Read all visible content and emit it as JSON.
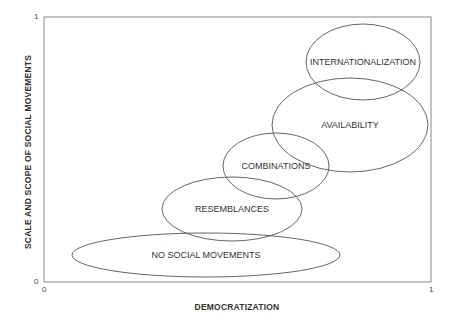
{
  "diagram": {
    "y_axis": {
      "label": "SCALE AND SCOPE OF SOCIAL MOVEMENTS",
      "min_tick": "0",
      "max_tick": "1"
    },
    "x_axis": {
      "label": "DEMOCRATIZATION",
      "min_tick": "0",
      "max_tick": "1"
    },
    "frame": {
      "x1": 44,
      "y1": 17,
      "x2": 431,
      "y2": 282,
      "color": "#888888"
    },
    "stroke_color": "#555555",
    "regions": [
      {
        "label": "NO SOCIAL MOVEMENTS",
        "cx": 206,
        "cy": 255,
        "rx": 134,
        "ry": 22
      },
      {
        "label": "RESEMBLANCES",
        "cx": 232,
        "cy": 209,
        "rx": 70,
        "ry": 32
      },
      {
        "label": "COMBINATIONS",
        "cx": 276,
        "cy": 166,
        "rx": 53,
        "ry": 33
      },
      {
        "label": "AVAILABILITY",
        "cx": 350,
        "cy": 125,
        "rx": 78,
        "ry": 47
      },
      {
        "label": "INTERNATIONALIZATION",
        "cx": 363,
        "cy": 62,
        "rx": 57,
        "ry": 38
      }
    ]
  }
}
